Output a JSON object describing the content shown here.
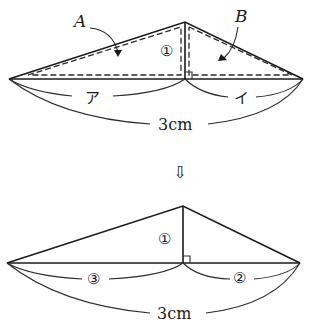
{
  "top_figure": {
    "label_A": "A",
    "label_B": "B",
    "height_label": "①",
    "left_segment_label": "ア",
    "right_segment_label": "イ",
    "total_length_label": "3cm"
  },
  "transition_arrow": "⇩",
  "bottom_figure": {
    "height_label": "①",
    "left_segment_label": "③",
    "right_segment_label": "②",
    "total_length_label": "3cm"
  }
}
